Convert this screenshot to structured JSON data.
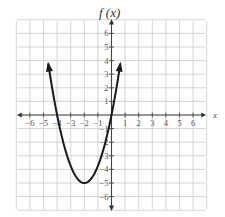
{
  "chart_data": {
    "type": "line",
    "title": "",
    "xlabel": "x",
    "ylabel": "f (x)",
    "xlim": [
      -7,
      7
    ],
    "ylim": [
      -7,
      7
    ],
    "grid": true,
    "x_ticks": [
      -6,
      -5,
      -4,
      -3,
      -2,
      -1,
      1,
      2,
      3,
      4,
      5,
      6
    ],
    "y_ticks": [
      -6,
      -5,
      -4,
      -3,
      -2,
      -1,
      1,
      2,
      3,
      4,
      5,
      6
    ],
    "x_tick_labels": [
      "−6",
      "−5",
      "−4",
      "−3",
      "−2",
      "−1",
      "1",
      "2",
      "3",
      "4",
      "5",
      "6"
    ],
    "y_tick_labels": [
      "−6",
      "−5",
      "−4",
      "−3",
      "−2",
      "−1",
      "1",
      "2",
      "3",
      "4",
      "5",
      "6"
    ],
    "series": [
      {
        "name": "f(x)",
        "description": "Upward-opening parabola with vertex at (-2, -5), x-intercepts near -4 and 0, arrows at both ends",
        "formula": "f(x) = 1.25(x + 2)^2 - 5",
        "vertex": [
          -2,
          -5
        ],
        "x_intercepts": [
          -4,
          0
        ],
        "x": [
          -4.65,
          -4,
          -3,
          -2,
          -1,
          0,
          0.65
        ],
        "y": [
          3.78,
          0,
          -3.75,
          -5,
          -3.75,
          0,
          3.78
        ],
        "color": "#1a1a1a"
      }
    ]
  },
  "labels": {
    "y_axis_title": "f (x)",
    "x_axis_title": "x"
  }
}
